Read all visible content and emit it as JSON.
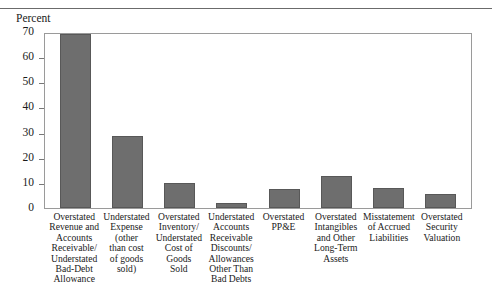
{
  "figure": {
    "title_cropped": "Financial Statement Fraud Schemes",
    "y_axis_caption": "Percent"
  },
  "chart_data": {
    "type": "bar",
    "title": "",
    "xlabel": "",
    "ylabel": "Percent",
    "ylim": [
      0,
      70
    ],
    "yticks": [
      0,
      10,
      20,
      30,
      40,
      50,
      60,
      70
    ],
    "ytick_labels": [
      "0",
      "10",
      "20",
      "30",
      "40",
      "50",
      "60",
      "70"
    ],
    "grid": false,
    "legend": "none",
    "bar_color": "#6e6e6e",
    "categories": [
      "Overstated\nRevenue and\nAccounts\nReceivable/\nUnderstated\nBad-Debt\nAllowance",
      "Understated\nExpense\n(other\nthan cost\nof goods\nsold)",
      "Overstated\nInventory/\nUnderstated\nCost of\nGoods\nSold",
      "Understated\nAccounts\nReceivable\nDiscounts/\nAllowances\nOther Than\nBad Debts",
      "Overstated\nPP&E",
      "Overstated\nIntangibles\nand Other\nLong-Term\nAssets",
      "Misstatement\nof Accrued\nLiabilities",
      "Overstated\nSecurity\nValuation"
    ],
    "values": [
      70,
      29,
      10,
      2,
      7.5,
      13,
      8,
      5.5
    ]
  }
}
